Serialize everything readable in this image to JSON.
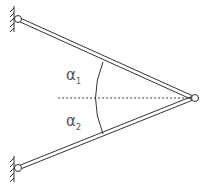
{
  "diagram": {
    "type": "two-bar truss with pinned wall supports",
    "labels": {
      "angle1": "α",
      "angle1_sub": "1",
      "angle2": "α",
      "angle2_sub": "2"
    },
    "elements": [
      {
        "name": "upper-bar",
        "from": "top-wall-pin",
        "to": "joint-pin"
      },
      {
        "name": "lower-bar",
        "from": "bottom-wall-pin",
        "to": "joint-pin"
      },
      {
        "name": "horizontal-reference-line",
        "style": "dashed"
      },
      {
        "name": "angle-arc"
      }
    ],
    "colors": {
      "stroke": "#333333",
      "background": "#ffffff"
    }
  }
}
